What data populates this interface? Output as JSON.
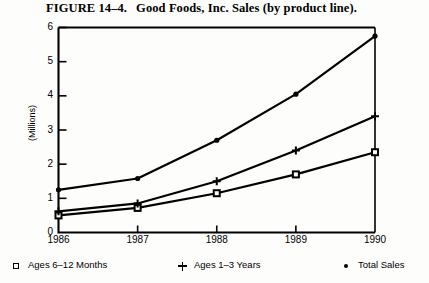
{
  "figure": {
    "number_label": "FIGURE 14–4.",
    "caption": "Good Foods, Inc. Sales (by product line)."
  },
  "legend": {
    "items": [
      {
        "marker": "open-square-marker",
        "label": "Ages 6–12 Months"
      },
      {
        "marker": "plus-marker",
        "label": "Ages 1–3 Years"
      },
      {
        "marker": "filled-dot-marker",
        "label": "Total Sales"
      }
    ]
  },
  "chart_data": {
    "type": "line",
    "title": "Good Foods, Inc. Sales (by product line).",
    "xlabel": "",
    "ylabel": "(Millions)",
    "categories": [
      "1986",
      "1987",
      "1988",
      "1989",
      "1990"
    ],
    "x_tick_labels": [
      "1986",
      "1987",
      "1988",
      "1989",
      "1990"
    ],
    "y_tick_labels": [
      "0",
      "1",
      "2",
      "3",
      "4",
      "5",
      "6"
    ],
    "y_ticks": [
      0,
      1,
      2,
      3,
      4,
      5,
      6
    ],
    "ylim": [
      0,
      6
    ],
    "grid": false,
    "legend_position": "below-plot",
    "series": [
      {
        "name": "Ages 6–12 Months",
        "marker": "open-square-marker",
        "values": [
          0.5,
          0.72,
          1.15,
          1.7,
          2.35
        ]
      },
      {
        "name": "Ages 1–3 Years",
        "marker": "plus-marker",
        "values": [
          0.62,
          0.85,
          1.5,
          2.4,
          3.4
        ]
      },
      {
        "name": "Total Sales",
        "marker": "filled-dot-marker",
        "values": [
          1.25,
          1.58,
          2.7,
          4.05,
          5.75
        ]
      }
    ]
  },
  "colors": {
    "ink": "#000000",
    "page": "#fdfdfc"
  }
}
